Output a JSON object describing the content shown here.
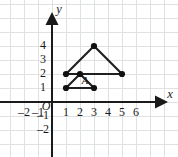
{
  "figure": {
    "kind": "coordinate-grid-triangles",
    "width": 178,
    "height": 157,
    "background_color": "#ffffff",
    "grid_color": "#dfe2e3",
    "axis_color": "#1a1a1a",
    "shape_color": "#1f1f1f"
  },
  "axes": {
    "x_axis_name": "x",
    "y_axis_name": "y",
    "origin_label": "O",
    "x_tick_labels": [
      "–2",
      "–1",
      "1",
      "2",
      "3",
      "4",
      "5",
      "6"
    ],
    "x_tick_values": [
      -2,
      -1,
      1,
      2,
      3,
      4,
      5,
      6
    ],
    "y_tick_labels": [
      "4",
      "3",
      "2",
      "1",
      "–1",
      "–2"
    ],
    "y_tick_values": [
      4,
      3,
      2,
      1,
      -1,
      -2
    ],
    "x_range": [
      -3,
      7
    ],
    "y_range": [
      -3,
      5
    ],
    "grid": true,
    "grid_step": 1
  },
  "chart_data": {
    "type": "scatter",
    "title": "",
    "xlabel": "x",
    "ylabel": "y",
    "xlim": [
      -3,
      7
    ],
    "ylim": [
      -3,
      5
    ],
    "grid": true,
    "series": [
      {
        "name": "large-triangle",
        "closed": true,
        "points": [
          [
            1,
            2
          ],
          [
            3,
            4
          ],
          [
            5,
            2
          ]
        ]
      },
      {
        "name": "small-triangle-A",
        "closed": true,
        "label": "A",
        "label_point": [
          2,
          1.45
        ],
        "points": [
          [
            1,
            1
          ],
          [
            2,
            2
          ],
          [
            3,
            1
          ]
        ]
      }
    ],
    "marked_points": [
      [
        1,
        2
      ],
      [
        3,
        4
      ],
      [
        5,
        2
      ],
      [
        2,
        2
      ],
      [
        1,
        1
      ],
      [
        3,
        1
      ]
    ]
  },
  "labels": {
    "triangle_a": "A"
  }
}
